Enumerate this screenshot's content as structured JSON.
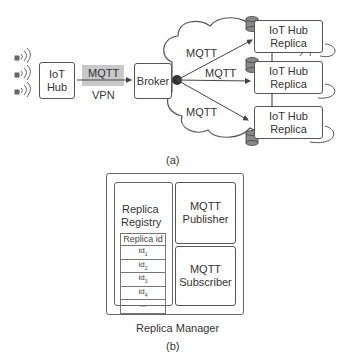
{
  "diagram_a": {
    "iot_hub": {
      "line1": "IoT",
      "line2": "Hub"
    },
    "link_protocol": "MQTT",
    "link_tunnel": "VPN",
    "broker": "Broker",
    "cloud_links": [
      "MQTT",
      "MQTT",
      "MQTT"
    ],
    "replicas": [
      {
        "line1": "IoT Hub",
        "line2": "Replica"
      },
      {
        "line1": "IoT Hub",
        "line2": "Replica"
      },
      {
        "line1": "IoT Hub",
        "line2": "Replica"
      }
    ],
    "caption": "(a)",
    "colors": {
      "stroke": "#555555",
      "mqtt_highlight": "#c8c8c8",
      "broker_dot": "#333333",
      "db_fill": "#888888"
    }
  },
  "diagram_b": {
    "replica_registry": {
      "line1": "Replica",
      "line2": "Registry"
    },
    "registry_table": {
      "header": "Replica id",
      "rows": [
        {
          "base": "id",
          "sub": "1"
        },
        {
          "base": "id",
          "sub": "2"
        },
        {
          "base": "id",
          "sub": "3"
        },
        {
          "base": "id",
          "sub": "4"
        },
        {
          "base": "...",
          "sub": ""
        }
      ]
    },
    "publisher": {
      "line1": "MQTT",
      "line2": "Publisher"
    },
    "subscriber": {
      "line1": "MQTT",
      "line2": "Subscriber"
    },
    "container_label": "Replica Manager",
    "caption": "(b)"
  }
}
